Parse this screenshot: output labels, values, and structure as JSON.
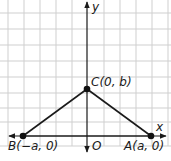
{
  "figure": {
    "type": "coordinate-geometry-diagram",
    "grid": {
      "spacing": 16,
      "color": "#cfcfcf",
      "visible": true
    },
    "axes": {
      "x_label": "x",
      "y_label": "y",
      "origin_label": "O",
      "color": "#1a1a1a"
    },
    "points": [
      {
        "id": "C",
        "label": "C(0, b)",
        "name": "C",
        "coords": "(0, b)"
      },
      {
        "id": "B",
        "label": "B(−a, 0)",
        "name": "B",
        "coords": "(−a, 0)"
      },
      {
        "id": "A",
        "label": "A(a, 0)",
        "name": "A",
        "coords": "(a, 0)"
      }
    ],
    "segments": [
      {
        "from": "B",
        "to": "C"
      },
      {
        "from": "C",
        "to": "A"
      },
      {
        "from": "B",
        "to": "A"
      }
    ],
    "shape": "isosceles triangle ABC"
  }
}
